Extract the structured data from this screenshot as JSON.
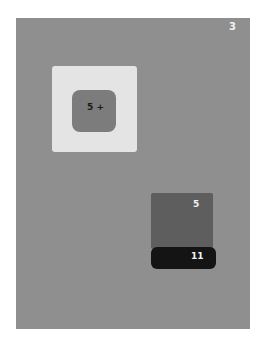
{
  "page": {
    "number": "3"
  },
  "swatches": {
    "inner_label": "5 +",
    "middle_label": "5",
    "dark_label": "11"
  },
  "colors": {
    "background": "#8f8f8f",
    "outer_square": "#e4e4e4",
    "inner_square": "#7c7c7c",
    "middle_rect": "#5e5e5e",
    "dark_rect": "#141414"
  }
}
